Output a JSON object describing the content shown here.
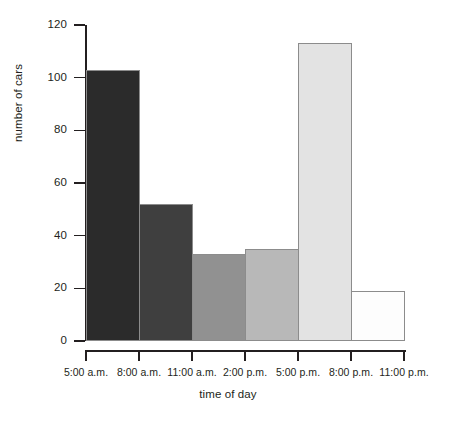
{
  "chart_data": {
    "type": "bar",
    "title": "",
    "xlabel": "time of day",
    "ylabel": "number of cars",
    "categories": [
      "5:00 a.m. - 8:00 a.m.",
      "8:00 a.m. - 11:00 a.m.",
      "11:00 a.m. - 2:00 p.m.",
      "2:00 p.m. - 5:00 p.m.",
      "5:00 p.m. - 8:00 p.m.",
      "8:00 p.m. - 11:00 p.m."
    ],
    "values": [
      103,
      52,
      33,
      35,
      113,
      19
    ],
    "bar_colors": [
      "#2b2b2b",
      "#3f3f3f",
      "#919191",
      "#b8b8b8",
      "#e3e3e3",
      "#fdfdfd"
    ],
    "bar_border_color": "#8c8c8c",
    "x_tick_labels": [
      "5:00 a.m.",
      "8:00 a.m.",
      "11:00 a.m.",
      "2:00 p.m.",
      "5:00 p.m.",
      "8:00 p.m.",
      "11:00 p.m."
    ],
    "y_tick_labels": [
      "120",
      "100",
      "80",
      "60",
      "40",
      "20",
      "0"
    ],
    "y_tick_values": [
      120,
      100,
      80,
      60,
      40,
      20,
      0
    ],
    "ylim": [
      0,
      120
    ],
    "grid": false,
    "legend": false,
    "axis_color": "#231f20",
    "background_color": "#ffffff"
  }
}
